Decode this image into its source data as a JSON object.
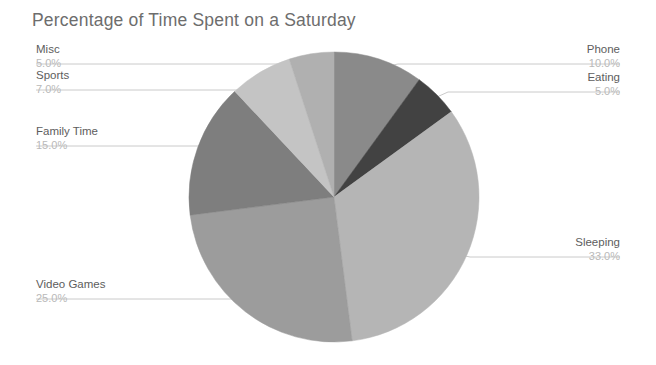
{
  "chart_data": {
    "type": "pie",
    "title": "Percentage of Time Spent on a Saturday",
    "xlabel": "",
    "ylabel": "",
    "grid": false,
    "legend": "none",
    "value_suffix": "%",
    "value_format": "1 decimal",
    "start_angle_deg": 0,
    "direction": "clockwise",
    "categories": [
      "Phone",
      "Eating",
      "Sleeping",
      "Video Games",
      "Family Time",
      "Sports",
      "Misc"
    ],
    "values": [
      10.0,
      5.0,
      33.0,
      25.0,
      15.0,
      7.0,
      5.0
    ],
    "total": 100.0,
    "colors": [
      "#8a8a8a",
      "#424242",
      "#b5b5b5",
      "#9c9c9c",
      "#7e7e7e",
      "#c4c4c4",
      "#b0b0b0"
    ],
    "slices": [
      {
        "name": "Phone",
        "percent_label": "10.0%",
        "value": 10.0,
        "color": "#8a8a8a"
      },
      {
        "name": "Eating",
        "percent_label": "5.0%",
        "value": 5.0,
        "color": "#424242"
      },
      {
        "name": "Sleeping",
        "percent_label": "33.0%",
        "value": 33.0,
        "color": "#b5b5b5"
      },
      {
        "name": "Video Games",
        "percent_label": "25.0%",
        "value": 25.0,
        "color": "#9c9c9c"
      },
      {
        "name": "Family Time",
        "percent_label": "15.0%",
        "value": 15.0,
        "color": "#7e7e7e"
      },
      {
        "name": "Sports",
        "percent_label": "7.0%",
        "value": 7.0,
        "color": "#c4c4c4"
      },
      {
        "name": "Misc",
        "percent_label": "5.0%",
        "value": 5.0,
        "color": "#b0b0b0"
      }
    ]
  },
  "labels": {
    "misc_name": "Misc",
    "misc_pct": "5.0%",
    "sports_name": "Sports",
    "sports_pct": "7.0%",
    "family_name": "Family Time",
    "family_pct": "15.0%",
    "video_name": "Video Games",
    "video_pct": "25.0%",
    "phone_name": "Phone",
    "phone_pct": "10.0%",
    "eating_name": "Eating",
    "eating_pct": "5.0%",
    "sleeping_name": "Sleeping",
    "sleeping_pct": "33.0%"
  },
  "style": {
    "title_color": "#6d6d6d",
    "label_color": "#5d5d5d",
    "percent_color": "#b9b9b9",
    "leader_color": "#bdbdbd",
    "background": "#ffffff"
  }
}
